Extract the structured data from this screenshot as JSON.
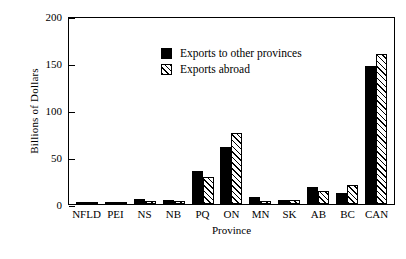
{
  "chart_data": {
    "type": "bar",
    "title": "",
    "xlabel": "Province",
    "ylabel": "Billions of Dollars",
    "ylim": [
      0,
      200
    ],
    "yticks": [
      0,
      50,
      100,
      150,
      200
    ],
    "ytick_labels": [
      "0",
      "50",
      "100",
      "150",
      "200"
    ],
    "grid": false,
    "legend_position": "upper-left-inside",
    "categories": [
      "NFLD",
      "PEI",
      "NS",
      "NB",
      "PQ",
      "ON",
      "MN",
      "SK",
      "AB",
      "BC",
      "CAN"
    ],
    "series": [
      {
        "name": "Exports to other provinces",
        "style": "solid-black",
        "values": [
          1.5,
          0.8,
          5.0,
          4.5,
          35.0,
          61.0,
          7.0,
          4.0,
          18.0,
          12.0,
          147.0
        ]
      },
      {
        "name": "Exports abroad",
        "style": "diagonal-hatch",
        "values": [
          2.5,
          0.6,
          3.0,
          3.5,
          29.0,
          76.0,
          3.0,
          4.5,
          14.0,
          20.0,
          160.0
        ]
      }
    ]
  },
  "legend": {
    "entries": [
      {
        "label": "Exports to other provinces",
        "swatch": "solid-black-swatch"
      },
      {
        "label": "Exports abroad",
        "swatch": "hatched-swatch"
      }
    ]
  }
}
